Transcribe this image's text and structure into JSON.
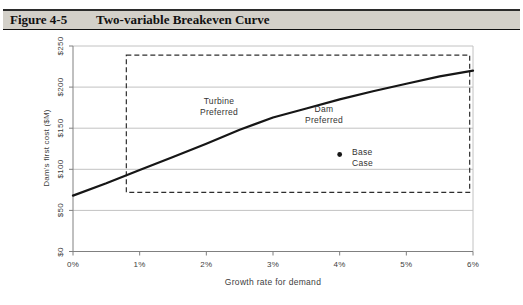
{
  "figure_header": {
    "label": "Figure 4-5",
    "title": "Two-variable Breakeven Curve"
  },
  "colors": {
    "header_bg": "#d3d0c9",
    "grid": "#c2c2c2",
    "axis": "#808080",
    "curve": "#161616",
    "region_dash": "#2e2e2e",
    "text": "#404040"
  },
  "chart_data": {
    "type": "line",
    "title": "Two-variable Breakeven Curve",
    "xlabel": "Growth rate for demand",
    "ylabel": "Dam's first cost ($M)",
    "xlim": [
      0,
      6
    ],
    "ylim": [
      0,
      250
    ],
    "x_tick_labels": [
      "0%",
      "1%",
      "2%",
      "3%",
      "4%",
      "5%",
      "6%"
    ],
    "x_tick_values": [
      0,
      1,
      2,
      3,
      4,
      5,
      6
    ],
    "y_tick_labels": [
      "$0",
      "$50",
      "$100",
      "$150",
      "$200",
      "$250"
    ],
    "y_tick_values": [
      0,
      50,
      100,
      150,
      200,
      250
    ],
    "grid": "horizontal",
    "series": [
      {
        "name": "breakeven-curve",
        "x": [
          0,
          0.5,
          1,
          1.5,
          2,
          2.5,
          3,
          3.5,
          4,
          4.5,
          5,
          5.5,
          6
        ],
        "y": [
          68,
          83,
          99,
          115,
          131,
          148,
          163,
          174,
          185,
          195,
          204,
          213,
          220
        ]
      }
    ],
    "points": [
      {
        "name": "base-case",
        "x": 4,
        "y": 118
      }
    ],
    "region_box": {
      "x0": 0.8,
      "x1": 5.95,
      "y0": 72,
      "y1": 239,
      "style": "dashed"
    },
    "annotations": {
      "turbine": {
        "line1": "Turbine",
        "line2": "Preferred"
      },
      "dam": {
        "line1": "Dam",
        "line2": "Preferred"
      },
      "base_case": {
        "line1": "Base",
        "line2": "Case"
      }
    }
  }
}
